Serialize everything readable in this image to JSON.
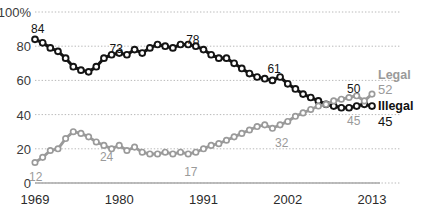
{
  "chart_data": {
    "type": "line",
    "title": "",
    "subtitle": "",
    "xlabel": "",
    "ylabel": "",
    "xlim": [
      1969,
      2013
    ],
    "ylim": [
      0,
      100
    ],
    "grid": true,
    "grid_style": "dotted horizontal",
    "legend_position": "right",
    "y_ticks": [
      "0",
      "20",
      "40",
      "60",
      "80",
      "100%"
    ],
    "y_tick_values": [
      0,
      20,
      40,
      60,
      80,
      100
    ],
    "x_ticks": [
      "1969",
      "1980",
      "1991",
      "2002",
      "2013"
    ],
    "x_tick_values": [
      1969,
      1980,
      1991,
      2002,
      2013
    ],
    "x": [
      1969,
      1970,
      1971,
      1972,
      1973,
      1974,
      1975,
      1976,
      1977,
      1978,
      1979,
      1980,
      1981,
      1982,
      1983,
      1984,
      1985,
      1986,
      1987,
      1988,
      1989,
      1990,
      1991,
      1992,
      1993,
      1994,
      1995,
      1996,
      1997,
      1998,
      1999,
      2000,
      2001,
      2002,
      2003,
      2004,
      2005,
      2006,
      2007,
      2008,
      2009,
      2010,
      2011,
      2012,
      2013
    ],
    "series": [
      {
        "name": "Illegal",
        "color": "#141414",
        "marker": "circle-open-dark",
        "end_value": 45,
        "values": [
          84,
          82,
          79,
          77,
          73,
          68,
          66,
          65,
          68,
          73,
          75,
          76,
          75,
          78,
          76,
          79,
          81,
          80,
          79,
          81,
          81,
          80,
          78,
          75,
          73,
          73,
          70,
          67,
          64,
          62,
          61,
          60,
          62,
          58,
          55,
          52,
          50,
          48,
          46,
          45,
          44,
          44,
          45,
          46,
          45
        ]
      },
      {
        "name": "Legal",
        "color": "#9a9a9a",
        "marker": "circle-open-gray",
        "end_value": 52,
        "values": [
          12,
          15,
          19,
          20,
          26,
          30,
          29,
          27,
          24,
          22,
          20,
          22,
          19,
          21,
          18,
          17,
          17,
          18,
          17,
          18,
          17,
          18,
          20,
          22,
          23,
          25,
          27,
          29,
          31,
          33,
          34,
          32,
          34,
          36,
          39,
          41,
          43,
          45,
          46,
          48,
          49,
          50,
          51,
          48,
          52
        ]
      }
    ],
    "point_labels": [
      {
        "series": "Illegal",
        "text": "84",
        "x": 1969,
        "y": 84
      },
      {
        "series": "Illegal",
        "text": "73",
        "x": 1979,
        "y": 73
      },
      {
        "series": "Illegal",
        "text": "78",
        "x": 1989,
        "y": 78
      },
      {
        "series": "Illegal",
        "text": "61",
        "x": 2000,
        "y": 61
      },
      {
        "series": "Illegal",
        "text": "50",
        "x": 2010,
        "y": 50
      },
      {
        "series": "Legal",
        "text": "12",
        "x": 1969,
        "y": 12
      },
      {
        "series": "Legal",
        "text": "24",
        "x": 1978,
        "y": 24
      },
      {
        "series": "Legal",
        "text": "17",
        "x": 1989,
        "y": 17
      },
      {
        "series": "Legal",
        "text": "32",
        "x": 2001,
        "y": 32
      },
      {
        "series": "Legal",
        "text": "45",
        "x": 2010,
        "y": 45
      }
    ],
    "legend": [
      {
        "name": "Legal",
        "value": "52",
        "color": "#9a9a9a"
      },
      {
        "name": "Illegal",
        "value": "45",
        "color": "#111111"
      }
    ]
  }
}
